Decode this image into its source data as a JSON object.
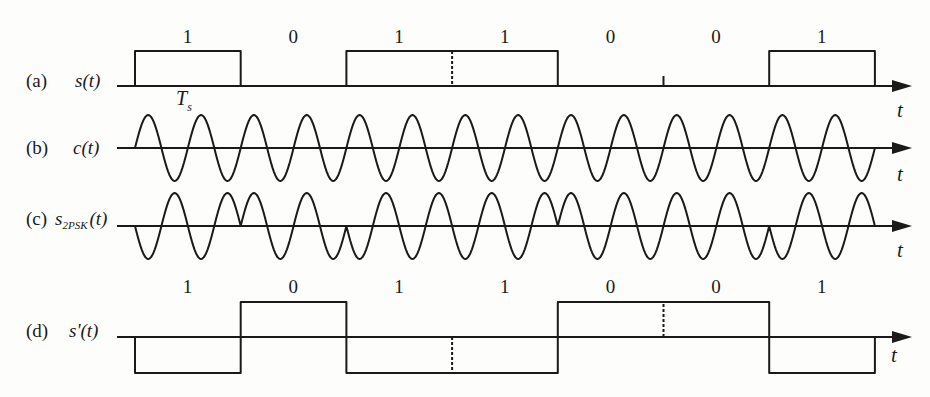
{
  "diagram": {
    "bits": [
      1,
      0,
      1,
      1,
      0,
      0,
      1
    ],
    "bit_labels": [
      "1",
      "0",
      "1",
      "1",
      "0",
      "0",
      "1"
    ],
    "cycles_per_bit": 2,
    "symbol_period_label": "T",
    "symbol_period_sub": "s",
    "axis_label": "t",
    "rows": [
      {
        "id": "a",
        "tag": "(a)",
        "signal": "s(t)",
        "description": "binary data signal"
      },
      {
        "id": "b",
        "tag": "(b)",
        "signal": "c(t)",
        "description": "carrier"
      },
      {
        "id": "c",
        "tag": "(c)",
        "signal_main": "s",
        "signal_sub": "2PSK",
        "signal_tail": "(t)",
        "description": "2PSK modulated signal"
      },
      {
        "id": "d",
        "tag": "(d)",
        "signal": "s'(t)",
        "description": "bipolar data signal"
      }
    ],
    "colors": {
      "stroke": "#1a1a1a",
      "background": "#fdfdfc"
    }
  }
}
